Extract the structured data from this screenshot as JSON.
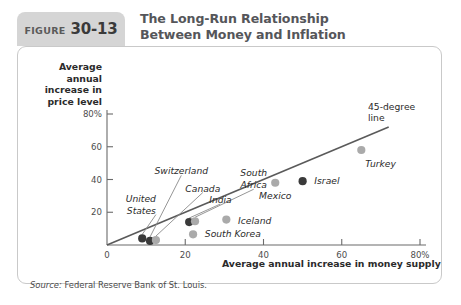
{
  "header": {
    "figure_word": "FIGURE",
    "figure_number": "30-13",
    "title_line1": "The Long-Run Relationship",
    "title_line2": "Between Money and Inflation"
  },
  "axes": {
    "ylabel_line1": "Average annual",
    "ylabel_line2": "increase in",
    "ylabel_line3": "price level",
    "xlabel": "Average annual increase in money supply"
  },
  "source": {
    "prefix": "Source:",
    "text": "Federal Reserve Bank of St. Louis."
  },
  "annotations": {
    "ref_line_label_1": "45-degree",
    "ref_line_label_2": "line"
  },
  "chart_data": {
    "type": "scatter",
    "title": "The Long-Run Relationship Between Money and Inflation",
    "xlabel": "Average annual increase in money supply",
    "ylabel": "Average annual increase in price level",
    "xlim": [
      0,
      80
    ],
    "ylim": [
      0,
      88
    ],
    "xticks": [
      0,
      20,
      40,
      60,
      80
    ],
    "yticks": [
      20,
      40,
      60,
      80
    ],
    "xtick_labels": [
      "0",
      "20",
      "40",
      "60",
      "80%"
    ],
    "ytick_labels": [
      "20",
      "40",
      "60",
      "80%"
    ],
    "grid": false,
    "legend": "none",
    "reference_line": {
      "label": "45-degree line",
      "from": [
        0,
        0
      ],
      "to": [
        72,
        72
      ]
    },
    "points": [
      {
        "name": "United States",
        "x": 9.0,
        "y": 4.0,
        "shade": "dark",
        "label_x": 12.5,
        "label_y": 28.0,
        "label_line2_y": 21.0,
        "label_anchor": "end"
      },
      {
        "name": "Switzerland",
        "x": 11.0,
        "y": 2.5,
        "shade": "dark",
        "label_x": 19.0,
        "label_y": 45.0,
        "label_anchor": "middle"
      },
      {
        "name": "Canada",
        "x": 12.5,
        "y": 3.0,
        "shade": "light",
        "label_x": 24.5,
        "label_y": 34.5,
        "label_anchor": "middle"
      },
      {
        "name": "India",
        "x": 21.0,
        "y": 14.0,
        "shade": "dark",
        "label_x": 29.0,
        "label_y": 27.5,
        "label_anchor": "middle"
      },
      {
        "name": "South Africa",
        "x": 22.5,
        "y": 14.5,
        "shade": "light",
        "label_x": 37.5,
        "label_y": 44.0,
        "label_line2_y": 36.5,
        "label_anchor": "middle"
      },
      {
        "name": "South Korea",
        "x": 22.0,
        "y": 6.5,
        "shade": "light",
        "label_x": 25.0,
        "label_y": 6.5,
        "label_anchor": "start"
      },
      {
        "name": "Iceland",
        "x": 30.5,
        "y": 15.5,
        "shade": "light",
        "label_x": 33.5,
        "label_y": 14.5,
        "label_anchor": "start"
      },
      {
        "name": "Mexico",
        "x": 43.0,
        "y": 38.0,
        "shade": "light",
        "label_x": 43.0,
        "label_y": 30.0,
        "label_anchor": "middle"
      },
      {
        "name": "Israel",
        "x": 50.0,
        "y": 39.0,
        "shade": "dark",
        "label_x": 53.0,
        "label_y": 39.0,
        "label_anchor": "start"
      },
      {
        "name": "Turkey",
        "x": 65.0,
        "y": 58.0,
        "shade": "light",
        "label_x": 66.0,
        "label_y": 49.5,
        "label_anchor": "start"
      }
    ],
    "colors": {
      "dark_point": "#3a3a3a",
      "light_point": "#aaaaaa",
      "axis": "#6b6b6b",
      "reference_line": "#5a5a5a",
      "leader_line": "#8a8a8a"
    }
  }
}
